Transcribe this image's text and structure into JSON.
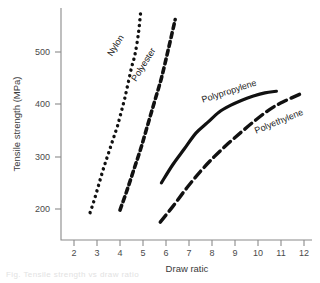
{
  "chart_data": {
    "type": "line",
    "title": "",
    "xlabel": "Draw ratic",
    "ylabel": "Tensile strength (MPa)",
    "xlim": [
      1.5,
      12.3
    ],
    "ylim": [
      140,
      600
    ],
    "xticks": [
      2,
      3,
      4,
      5,
      6,
      7,
      8,
      9,
      10,
      11,
      12
    ],
    "yticks": [
      200,
      300,
      400,
      500
    ],
    "grid": false,
    "legend_position": "inline-curve-labels",
    "series": [
      {
        "name": "Nylon",
        "style": "dotted",
        "label_rotation_deg": -58,
        "x": [
          2.7,
          2.85,
          3.0,
          3.15,
          3.3,
          3.45,
          3.6,
          3.75,
          3.9,
          4.05,
          4.2,
          4.35,
          4.5,
          4.65,
          4.8,
          4.9
        ],
        "y": [
          193,
          213,
          235,
          258,
          280,
          300,
          320,
          340,
          360,
          385,
          410,
          440,
          470,
          495,
          535,
          578
        ]
      },
      {
        "name": "Polyester",
        "style": "dashed",
        "label_rotation_deg": -58,
        "x": [
          4.0,
          4.3,
          4.6,
          4.9,
          5.2,
          5.5,
          5.8,
          6.1,
          6.4
        ],
        "y": [
          198,
          235,
          275,
          315,
          360,
          405,
          450,
          505,
          562
        ]
      },
      {
        "name": "Polypropylene",
        "style": "solid",
        "label_rotation_deg": -18,
        "x": [
          5.8,
          6.3,
          6.8,
          7.3,
          7.8,
          8.3,
          8.8,
          9.3,
          9.8,
          10.3,
          10.8
        ],
        "y": [
          250,
          285,
          315,
          345,
          365,
          385,
          398,
          408,
          416,
          422,
          425
        ]
      },
      {
        "name": "Polyethylene",
        "style": "long-dashed",
        "label_rotation_deg": -22,
        "x": [
          5.75,
          6.3,
          6.9,
          7.5,
          8.1,
          8.7,
          9.3,
          9.9,
          10.5,
          11.1,
          11.85
        ],
        "y": [
          175,
          205,
          240,
          272,
          300,
          325,
          348,
          370,
          390,
          405,
          420
        ]
      }
    ],
    "colors": {
      "series": "#111111",
      "axis": "#8a8a8a",
      "text": "#3a3a3a",
      "background": "#ffffff"
    }
  },
  "caption": {
    "ghost_text": "Fig. Tensile strength vs draw ratio"
  }
}
